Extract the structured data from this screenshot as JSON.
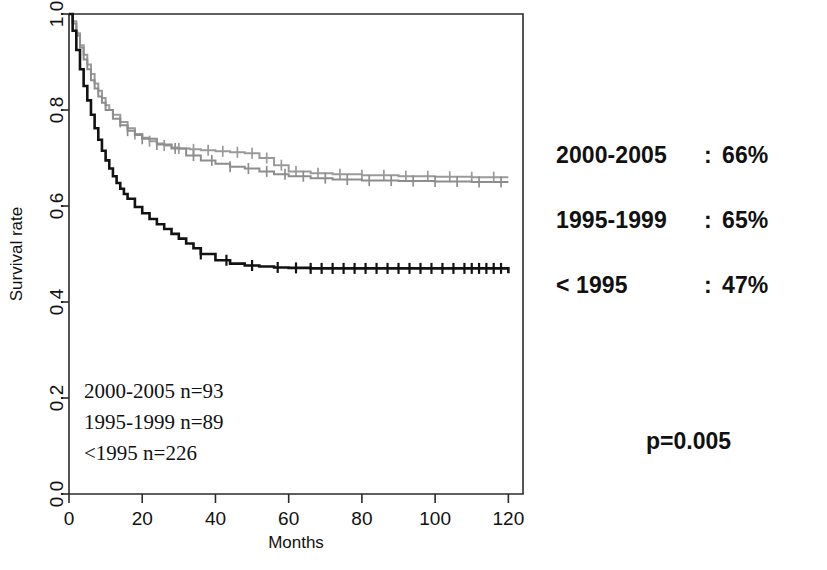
{
  "figure": {
    "axes": {
      "x_title": "Months",
      "y_title": "Survival rate",
      "x_ticks": [
        "0",
        "20",
        "40",
        "60",
        "80",
        "100",
        "120"
      ],
      "y_ticks": [
        "0.0",
        "0.2",
        "0.4",
        "0.6",
        "0.8",
        "1.0"
      ]
    },
    "in_plot_annotations": [
      "2000-2005 n=93",
      "1995-1999 n=89",
      "<1995 n=226"
    ]
  },
  "summary": {
    "rows": [
      {
        "label": "2000-2005",
        "separator": ":",
        "value": "66%"
      },
      {
        "label": "1995-1999",
        "separator": ":",
        "value": "65%"
      },
      {
        "label": "< 1995",
        "separator": ":",
        "value": "47%"
      }
    ],
    "p_value": "p=0.005"
  },
  "colors": {
    "cohort_2000_2005": "#9a9a9a",
    "cohort_1995_1999": "#8d8d8d",
    "cohort_pre_1995": "#121212",
    "axis": "#2b2b2b",
    "background": "#ffffff"
  },
  "chart_data": {
    "type": "line",
    "title": "",
    "xlabel": "Months",
    "ylabel": "Survival rate",
    "xlim": [
      0,
      124
    ],
    "ylim": [
      0.0,
      1.0
    ],
    "grid": false,
    "legend_position": "inside-lower-left",
    "note": "Kaplan-Meier survival curves, step function with censoring tick marks",
    "series": [
      {
        "name": "2000-2005",
        "n": 93,
        "final_survival": 0.66,
        "color": "#9a9a9a",
        "x": [
          0,
          1,
          2,
          3,
          4,
          5,
          6,
          7,
          8,
          9,
          10,
          11,
          12,
          14,
          16,
          18,
          20,
          22,
          24,
          26,
          28,
          30,
          33,
          36,
          40,
          44,
          48,
          52,
          56,
          60,
          66,
          72,
          80,
          90,
          100,
          110,
          120
        ],
        "y": [
          1.0,
          0.985,
          0.96,
          0.935,
          0.915,
          0.895,
          0.875,
          0.855,
          0.84,
          0.825,
          0.81,
          0.8,
          0.79,
          0.775,
          0.762,
          0.75,
          0.742,
          0.735,
          0.73,
          0.726,
          0.722,
          0.72,
          0.718,
          0.716,
          0.714,
          0.712,
          0.71,
          0.7,
          0.685,
          0.672,
          0.668,
          0.666,
          0.664,
          0.662,
          0.661,
          0.66,
          0.66
        ],
        "censor_x": [
          14,
          18,
          22,
          26,
          30,
          34,
          38,
          42,
          46,
          50,
          54,
          58,
          62,
          68,
          74,
          80,
          86,
          92,
          98,
          104,
          110,
          116
        ]
      },
      {
        "name": "1995-1999",
        "n": 89,
        "final_survival": 0.65,
        "color": "#8d8d8d",
        "x": [
          0,
          1,
          2,
          3,
          4,
          5,
          6,
          7,
          8,
          9,
          10,
          12,
          14,
          16,
          18,
          20,
          24,
          28,
          32,
          36,
          40,
          44,
          48,
          52,
          56,
          60,
          66,
          72,
          80,
          90,
          100,
          110,
          120
        ],
        "y": [
          1.0,
          0.98,
          0.955,
          0.93,
          0.905,
          0.885,
          0.862,
          0.845,
          0.828,
          0.815,
          0.8,
          0.782,
          0.768,
          0.757,
          0.748,
          0.74,
          0.728,
          0.72,
          0.705,
          0.695,
          0.688,
          0.682,
          0.678,
          0.672,
          0.666,
          0.662,
          0.658,
          0.655,
          0.653,
          0.652,
          0.651,
          0.65,
          0.65
        ],
        "censor_x": [
          16,
          20,
          24,
          29,
          34,
          39,
          44,
          49,
          54,
          59,
          64,
          70,
          76,
          82,
          88,
          94,
          100,
          106,
          112,
          118
        ]
      },
      {
        "name": "<1995",
        "n": 226,
        "final_survival": 0.47,
        "color": "#121212",
        "x": [
          0,
          1,
          2,
          3,
          4,
          5,
          6,
          7,
          8,
          9,
          10,
          11,
          12,
          13,
          14,
          15,
          16,
          18,
          20,
          22,
          24,
          26,
          28,
          30,
          32,
          34,
          36,
          40,
          44,
          48,
          52,
          56,
          60,
          66,
          72,
          80,
          90,
          100,
          110,
          118,
          120
        ],
        "y": [
          1.0,
          0.965,
          0.925,
          0.885,
          0.85,
          0.82,
          0.79,
          0.762,
          0.738,
          0.715,
          0.695,
          0.678,
          0.662,
          0.648,
          0.636,
          0.625,
          0.615,
          0.598,
          0.585,
          0.573,
          0.562,
          0.552,
          0.542,
          0.532,
          0.522,
          0.512,
          0.5,
          0.487,
          0.48,
          0.476,
          0.474,
          0.472,
          0.471,
          0.47,
          0.47,
          0.47,
          0.47,
          0.47,
          0.47,
          0.47,
          0.46
        ],
        "censor_x": [
          36,
          43,
          50,
          57,
          62,
          66,
          69,
          72,
          75,
          78,
          81,
          84,
          87,
          90,
          93,
          96,
          99,
          102,
          105,
          108,
          110,
          112,
          114,
          116,
          118
        ]
      }
    ]
  }
}
